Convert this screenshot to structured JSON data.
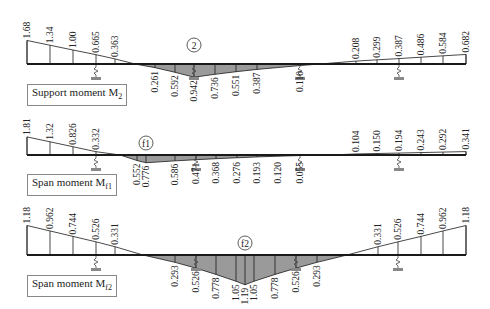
{
  "colors": {
    "line": "#1a1a1a",
    "fill_negative": "#9a9a9a",
    "fill_positive": "#ffffff",
    "support": "#888888"
  },
  "diagrams": [
    {
      "id": "support-moment-m2",
      "title_main": "Support moment M",
      "title_sub": "2",
      "marker": "2",
      "baseline_y": 64,
      "x_left": 27,
      "x_right": 466,
      "scale": 14,
      "title_pos": [
        27,
        84
      ],
      "marker_pos": [
        194,
        45
      ],
      "supports_x": [
        96,
        194,
        300,
        399
      ],
      "top_values": [
        {
          "x": 27,
          "v": "1.68",
          "m": 1.68
        },
        {
          "x": 50,
          "v": "1.34",
          "m": 1.34
        },
        {
          "x": 73,
          "v": "1.00",
          "m": 1.0
        },
        {
          "x": 96,
          "v": "0.665",
          "m": 0.665
        },
        {
          "x": 115,
          "v": "0.363",
          "m": 0.363
        },
        {
          "x": 356,
          "v": "0.208",
          "m": 0.208
        },
        {
          "x": 377,
          "v": "0.299",
          "m": 0.299
        },
        {
          "x": 399,
          "v": "0.387",
          "m": 0.387
        },
        {
          "x": 421,
          "v": "0.486",
          "m": 0.486
        },
        {
          "x": 443,
          "v": "0.584",
          "m": 0.584
        },
        {
          "x": 466,
          "v": "0.682",
          "m": 0.682
        }
      ],
      "bottom_values": [
        {
          "x": 155,
          "v": "0.261",
          "m": -0.261
        },
        {
          "x": 175,
          "v": "0.592",
          "m": -0.592
        },
        {
          "x": 194,
          "v": "0.942",
          "m": -0.942
        },
        {
          "x": 215,
          "v": "0.736",
          "m": -0.736
        },
        {
          "x": 236,
          "v": "0.551",
          "m": -0.551
        },
        {
          "x": 257,
          "v": "0.387",
          "m": -0.387
        },
        {
          "x": 300,
          "v": "0.110",
          "m": -0.11
        }
      ],
      "zero_left_x": 135,
      "zero_right_x": 320
    },
    {
      "id": "span-moment-mf1",
      "title_main": "Span moment M",
      "title_sub": "f1",
      "marker": "f1",
      "baseline_y": 155,
      "x_left": 27,
      "x_right": 466,
      "scale": 10,
      "title_pos": [
        27,
        174
      ],
      "marker_pos": [
        146,
        143
      ],
      "supports_x": [
        96,
        196,
        300,
        399
      ],
      "top_values": [
        {
          "x": 27,
          "v": "1.81",
          "m": 1.81
        },
        {
          "x": 50,
          "v": "1.32",
          "m": 1.32
        },
        {
          "x": 73,
          "v": "0.826",
          "m": 0.826
        },
        {
          "x": 96,
          "v": "0.332",
          "m": 0.332
        },
        {
          "x": 356,
          "v": "0.104",
          "m": 0.104
        },
        {
          "x": 377,
          "v": "0.150",
          "m": 0.15
        },
        {
          "x": 399,
          "v": "0.194",
          "m": 0.194
        },
        {
          "x": 421,
          "v": "0.243",
          "m": 0.243
        },
        {
          "x": 443,
          "v": "0.292",
          "m": 0.292
        },
        {
          "x": 466,
          "v": "0.341",
          "m": 0.341
        }
      ],
      "bottom_values": [
        {
          "x": 137,
          "v": "0.552",
          "m": -0.552
        },
        {
          "x": 146,
          "v": "0.776",
          "m": -0.776
        },
        {
          "x": 175,
          "v": "0.586",
          "m": -0.586
        },
        {
          "x": 196,
          "v": "0.471",
          "m": -0.471
        },
        {
          "x": 216,
          "v": "0.368",
          "m": -0.368
        },
        {
          "x": 237,
          "v": "0.276",
          "m": -0.276
        },
        {
          "x": 257,
          "v": "0.193",
          "m": -0.193
        },
        {
          "x": 278,
          "v": "0.120",
          "m": -0.12
        },
        {
          "x": 300,
          "v": "0.055",
          "m": -0.055
        }
      ],
      "zero_left_x": 120,
      "zero_right_x": 330
    },
    {
      "id": "span-moment-mf2",
      "title_main": "Span moment M",
      "title_sub": "f2",
      "marker": "f2",
      "baseline_y": 255,
      "x_left": 27,
      "x_right": 466,
      "scale": 25,
      "title_pos": [
        27,
        275
      ],
      "marker_pos": [
        245,
        243
      ],
      "supports_x": [
        96,
        196,
        296,
        398
      ],
      "top_values": [
        {
          "x": 27,
          "v": "1.18",
          "m": 1.18
        },
        {
          "x": 50,
          "v": "0.962",
          "m": 0.962
        },
        {
          "x": 73,
          "v": "0.744",
          "m": 0.744
        },
        {
          "x": 96,
          "v": "0.526",
          "m": 0.526
        },
        {
          "x": 115,
          "v": "0.331",
          "m": 0.331
        },
        {
          "x": 378,
          "v": "0.331",
          "m": 0.331
        },
        {
          "x": 398,
          "v": "0.526",
          "m": 0.526
        },
        {
          "x": 421,
          "v": "0.744",
          "m": 0.744
        },
        {
          "x": 443,
          "v": "0.962",
          "m": 0.962
        },
        {
          "x": 466,
          "v": "1.18",
          "m": 1.18
        }
      ],
      "bottom_values": [
        {
          "x": 175,
          "v": "0.293",
          "m": -0.293
        },
        {
          "x": 196,
          "v": "0.526",
          "m": -0.526
        },
        {
          "x": 216,
          "v": "0.778",
          "m": -0.778
        },
        {
          "x": 236,
          "v": "1.05",
          "m": -1.05
        },
        {
          "x": 245,
          "v": "1.19",
          "m": -1.19
        },
        {
          "x": 254,
          "v": "1.05",
          "m": -1.05
        },
        {
          "x": 275,
          "v": "0.778",
          "m": -0.778
        },
        {
          "x": 296,
          "v": "0.526",
          "m": -0.526
        },
        {
          "x": 317,
          "v": "0.293",
          "m": -0.293
        }
      ],
      "zero_left_x": 143,
      "zero_right_x": 347
    }
  ]
}
